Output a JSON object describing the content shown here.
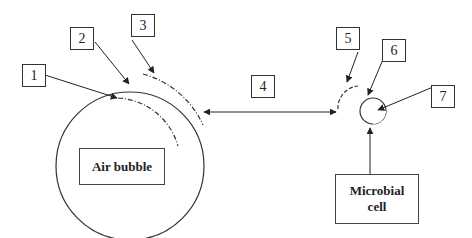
{
  "diagram": {
    "labels": [
      "1",
      "2",
      "3",
      "4",
      "5",
      "6",
      "7"
    ],
    "air_bubble_label": "Air bubble",
    "microbial_cell_label_line1": "Microbial",
    "microbial_cell_label_line2": "cell",
    "colors": {
      "stroke": "#333333",
      "background": "#ffffff"
    }
  }
}
